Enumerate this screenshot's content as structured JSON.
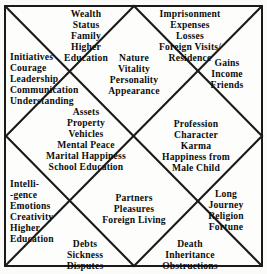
{
  "chart": {
    "type": "diagram",
    "shape": "square-with-diagonals-and-inscribed-diamond",
    "house_count": 12,
    "colors": {
      "background": "#fdfdfb",
      "line": "#1a1a1a",
      "text": "#0d0d0d"
    },
    "geometry": {
      "frame": {
        "x": 4,
        "y": 5,
        "width": 259,
        "height": 262
      },
      "center": {
        "x": 134,
        "y": 136
      },
      "diamond_vertices": [
        {
          "x": 134,
          "y": 6
        },
        {
          "x": 262,
          "y": 136
        },
        {
          "x": 134,
          "y": 266
        },
        {
          "x": 6,
          "y": 136
        }
      ]
    },
    "houses": [
      {
        "number": 1,
        "position": "center-top-diamond",
        "align": "center",
        "lines": [
          "Nature",
          "Vitality",
          "Personality",
          "Appearance"
        ]
      },
      {
        "number": 2,
        "position": "top-left-triangle",
        "align": "center",
        "lines": [
          "Wealth",
          "Status",
          "Family",
          "Higher",
          "Education"
        ]
      },
      {
        "number": 3,
        "position": "left-upper-triangle",
        "align": "left",
        "lines": [
          "Initiatives",
          "Courage",
          "Leadership",
          "Communication",
          "Understanding"
        ]
      },
      {
        "number": 4,
        "position": "center-left-diamond",
        "align": "center",
        "lines": [
          "Assets",
          "Property",
          "Vehicles",
          "Mental Peace",
          "Marital Happiness",
          "School Education"
        ]
      },
      {
        "number": 5,
        "position": "left-lower-triangle",
        "align": "left",
        "lines": [
          "Intelli-",
          "-gence",
          "Emotions",
          "Creativity",
          "Higher",
          "Education"
        ]
      },
      {
        "number": 6,
        "position": "bottom-left-triangle",
        "align": "center",
        "lines": [
          "Debts",
          "Sickness",
          "Disputes"
        ]
      },
      {
        "number": 7,
        "position": "center-bottom-diamond",
        "align": "center",
        "lines": [
          "Partners",
          "Pleasures",
          "Foreign Living"
        ]
      },
      {
        "number": 8,
        "position": "bottom-right-triangle",
        "align": "center",
        "lines": [
          "Death",
          "Inheritance",
          "Obstructions"
        ]
      },
      {
        "number": 9,
        "position": "right-lower-triangle",
        "align": "center",
        "lines": [
          "Long",
          "Journey",
          "Religion",
          "Fortune"
        ]
      },
      {
        "number": 10,
        "position": "center-right-diamond",
        "align": "center",
        "lines": [
          "Profession",
          "Character",
          "Karma",
          "Happiness from",
          "Male Child"
        ]
      },
      {
        "number": 11,
        "position": "right-upper-triangle",
        "align": "center",
        "lines": [
          "Gains",
          "Income",
          "Friends"
        ]
      },
      {
        "number": 12,
        "position": "top-right-triangle",
        "align": "center",
        "lines": [
          "Imprisonment",
          "Expenses",
          "Losses",
          "Foreign Visits/",
          "Residence"
        ]
      }
    ]
  }
}
